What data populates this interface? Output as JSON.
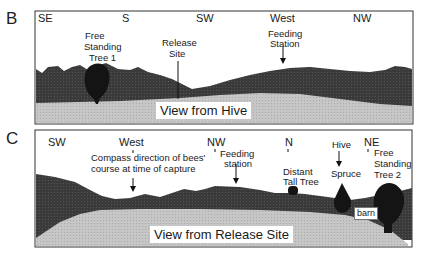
{
  "panels": [
    {
      "letter": "B",
      "view_label": "View from Hive",
      "directions": [
        "SE",
        "S",
        "SW",
        "West",
        "NW"
      ],
      "landmarks": {
        "tree1": [
          "Free",
          "Standing",
          "Tree 1"
        ],
        "release": [
          "Release",
          "Site"
        ],
        "feeding": [
          "Feeding",
          "Station"
        ]
      }
    },
    {
      "letter": "C",
      "view_label": "View from Release Site",
      "directions": [
        "SW",
        "West",
        "NW",
        "N",
        "NE"
      ],
      "landmarks": {
        "compass": [
          "Compass direction of bees'",
          "course at time of capture"
        ],
        "feeding": [
          "Feeding",
          "station"
        ],
        "distant": [
          "Distant",
          "Tall Tree"
        ],
        "hive": "Hive",
        "spruce": "Spruce",
        "barn": "barn",
        "tree2": [
          "Free",
          "Standing",
          "Tree 2"
        ]
      }
    }
  ],
  "colors": {
    "frame": "#333333",
    "hills": "#3a3a3a",
    "ground": "#c4c4c4",
    "trees": "#141414"
  }
}
